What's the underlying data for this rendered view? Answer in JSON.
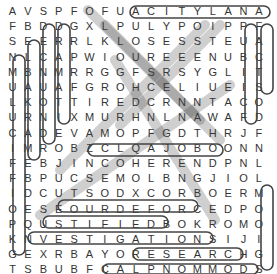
{
  "puzzle": {
    "type": "word-search",
    "rows": 18,
    "cols": 17,
    "grid": [
      "AVSPFOFUACITYLANA",
      "FBDDGXLPULYPOIPPF",
      "SEERRLKLOSESSTEUA",
      "NLCAPWIOUREEENUBC",
      "MBNMRRGGFSRSYGLIT",
      "UAUAFGROHCELIUEIS",
      "LKOTTIREDCRNNTACO",
      "URNIXMURHNLNAWAFD",
      "CADEVAMOPFGDTHRJF",
      "IMROBZCLQAJOBOONN",
      "FEBJINCOHERENDPNL",
      "FBPUCSEMOLBNGJIOL",
      "IDCUTSODXCORBOERM",
      "OESEOURDEFORCEDPO",
      "PQUSTIFIEDBOKROMO",
      "KNVESTIGATIONSIJI",
      "GEXRBAYORESEARCHG",
      "TSBUBFCALPNOMMODS"
    ],
    "found_words": [
      {
        "word": "ANALYTICA",
        "start": [
          0,
          16
        ],
        "end": [
          0,
          8
        ]
      },
      {
        "word": "PUBLIC",
        "start": [
          1,
          15
        ],
        "end": [
          6,
          15
        ]
      },
      {
        "word": "FACTS",
        "start": [
          1,
          16
        ],
        "end": [
          5,
          16
        ]
      },
      {
        "word": "JUSTIFIED",
        "start": [
          14,
          2
        ],
        "end": [
          14,
          10
        ]
      },
      {
        "word": "INVESTIGATION",
        "start": [
          15,
          1
        ],
        "end": [
          15,
          13
        ]
      },
      {
        "word": "RESEARCH",
        "start": [
          16,
          8
        ],
        "end": [
          16,
          15
        ]
      },
      {
        "word": "COMMON",
        "start": [
          17,
          6
        ],
        "end": [
          17,
          15
        ]
      },
      {
        "word": "ENFORCED",
        "start": [
          13,
          5
        ],
        "end": [
          13,
          14
        ]
      },
      {
        "word": "INCOHERENT",
        "start": [
          10,
          4
        ],
        "end": [
          10,
          13
        ]
      }
    ]
  }
}
